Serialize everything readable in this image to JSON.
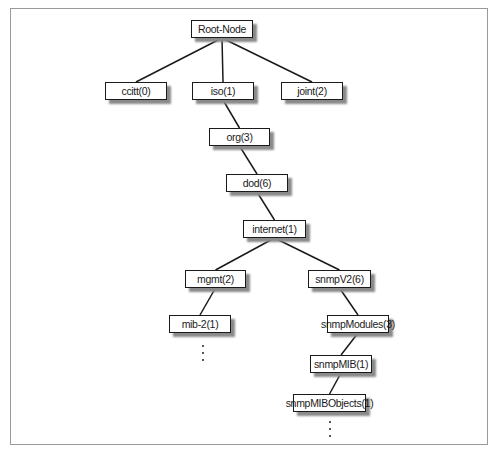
{
  "diagram": {
    "type": "tree",
    "title": "",
    "nodes": [
      {
        "id": "root",
        "label": "Root-Node"
      },
      {
        "id": "ccitt",
        "label": "ccitt(0)"
      },
      {
        "id": "iso",
        "label": "iso(1)"
      },
      {
        "id": "joint",
        "label": "joint(2)"
      },
      {
        "id": "org",
        "label": "org(3)"
      },
      {
        "id": "dod",
        "label": "dod(6)"
      },
      {
        "id": "internet",
        "label": "internet(1)"
      },
      {
        "id": "mgmt",
        "label": "mgmt(2)"
      },
      {
        "id": "snmpv2",
        "label": "snmpV2(6)"
      },
      {
        "id": "mib2",
        "label": "mib-2(1)"
      },
      {
        "id": "snmpmodules",
        "label": "snmpModules(3)"
      },
      {
        "id": "snmpmib",
        "label": "snmpMIB(1)"
      },
      {
        "id": "snmpmibobjects",
        "label": "snmpMIBObjects(1)"
      }
    ],
    "edges": [
      [
        "root",
        "ccitt"
      ],
      [
        "root",
        "iso"
      ],
      [
        "root",
        "joint"
      ],
      [
        "iso",
        "org"
      ],
      [
        "org",
        "dod"
      ],
      [
        "dod",
        "internet"
      ],
      [
        "internet",
        "mgmt"
      ],
      [
        "internet",
        "snmpv2"
      ],
      [
        "mgmt",
        "mib2"
      ],
      [
        "snmpv2",
        "snmpmodules"
      ],
      [
        "snmpmodules",
        "snmpmib"
      ],
      [
        "snmpmib",
        "snmpmibobjects"
      ]
    ],
    "continuations": [
      "mib2",
      "snmpmibobjects"
    ],
    "continuation_glyph": "⋮"
  }
}
